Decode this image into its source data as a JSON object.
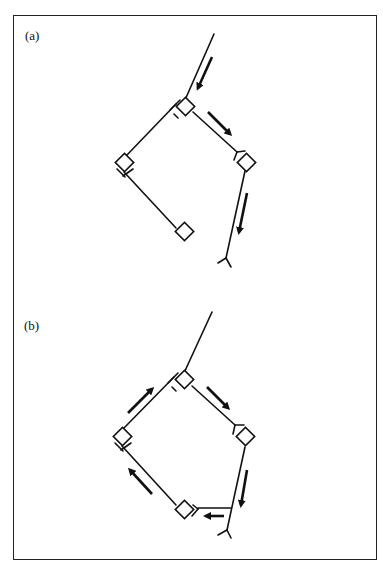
{
  "figure": {
    "panels": [
      {
        "label": "(a)",
        "description": "Open chain: stem enters from top, first unit, branches left (two units) and right (unit then terminal fork); arrows flow down stem, right branch and down to terminal."
      },
      {
        "label": "(b)",
        "description": "Closed cyclic chain: stem, top unit, right unit, terminal fork branch connecting back to lower unit, then left unit back to top; arrows indicate circular flow."
      }
    ],
    "colors": {
      "ink": "#111111",
      "background": "#ffffff"
    }
  }
}
